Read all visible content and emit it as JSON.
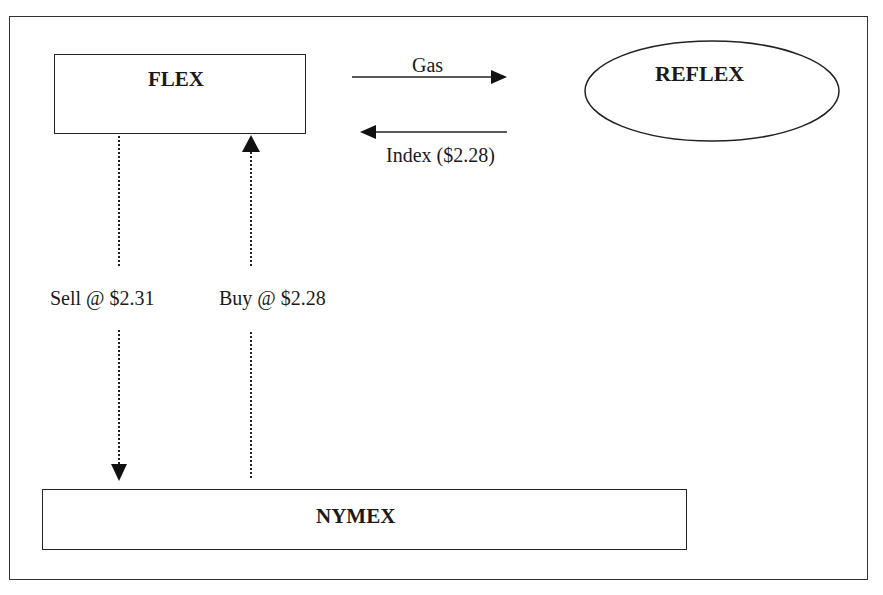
{
  "diagram": {
    "nodes": {
      "flex": {
        "label": "FLEX",
        "shape": "rectangle"
      },
      "reflex": {
        "label": "REFLEX",
        "shape": "ellipse"
      },
      "nymex": {
        "label": "NYMEX",
        "shape": "rectangle"
      }
    },
    "edges": [
      {
        "id": "gas",
        "from": "FLEX",
        "to": "REFLEX",
        "label": "Gas",
        "style": "solid"
      },
      {
        "id": "index",
        "from": "REFLEX",
        "to": "FLEX",
        "label": "Index ($2.28)",
        "style": "solid"
      },
      {
        "id": "sell",
        "from": "FLEX",
        "to": "NYMEX",
        "label": "Sell @ $2.31",
        "style": "dotted"
      },
      {
        "id": "buy",
        "from": "NYMEX",
        "to": "FLEX",
        "label": "Buy @ $2.28",
        "style": "dotted"
      }
    ],
    "colors": {
      "line": "#222222",
      "background": "#ffffff"
    }
  }
}
